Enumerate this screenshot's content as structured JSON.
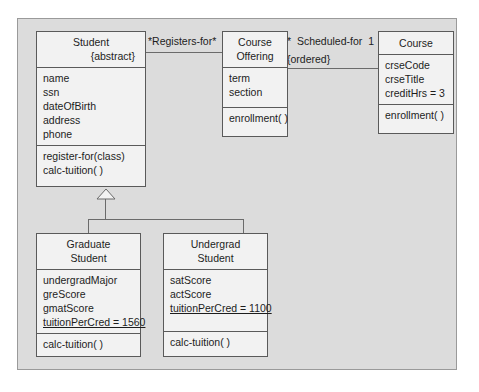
{
  "diagram": {
    "type": "uml-class-diagram",
    "frame_color": "#dcdcdc",
    "box_fill": "#f2f2f2",
    "line_color": "#6b6b6b",
    "classes": [
      {
        "id": "student",
        "name_lines": [
          "Student"
        ],
        "tag": "{abstract}",
        "attributes": [
          "name",
          "ssn",
          "dateOfBirth",
          "address",
          "phone"
        ],
        "operations": [
          "register-for(class)",
          "calc-tuition( )"
        ]
      },
      {
        "id": "course-offering",
        "name_lines": [
          "Course",
          "Offering"
        ],
        "tag": "",
        "attributes": [
          "term",
          "section"
        ],
        "operations": [
          "enrollment( )"
        ]
      },
      {
        "id": "course",
        "name_lines": [
          "Course"
        ],
        "tag": "",
        "attributes": [
          "crseCode",
          "crseTitle",
          "creditHrs = 3"
        ],
        "operations": [
          "enrollment( )"
        ]
      },
      {
        "id": "graduate-student",
        "name_lines": [
          "Graduate",
          "Student"
        ],
        "tag": "",
        "attributes": [
          "undergradMajor",
          "greScore",
          "gmatScore",
          "tuitionPerCred = 1560"
        ],
        "static_attribute_index": 3,
        "operations": [
          "calc-tuition( )"
        ]
      },
      {
        "id": "undergrad-student",
        "name_lines": [
          "Undergrad",
          "Student"
        ],
        "tag": "",
        "attributes": [
          "satScore",
          "actScore",
          "tuitionPerCred = 1100"
        ],
        "static_attribute_index": 2,
        "operations": [
          "calc-tuition( )"
        ]
      }
    ],
    "associations": [
      {
        "id": "registers-for",
        "label": "*Registers-for*",
        "from": "student",
        "to": "course-offering"
      },
      {
        "id": "scheduled-for",
        "label": "*  Scheduled-for  1",
        "constraint": "{ordered}",
        "from": "course-offering",
        "to": "course"
      }
    ],
    "generalization": {
      "id": "student-generalization",
      "parent": "student",
      "children": [
        "graduate-student",
        "undergrad-student"
      ]
    }
  }
}
